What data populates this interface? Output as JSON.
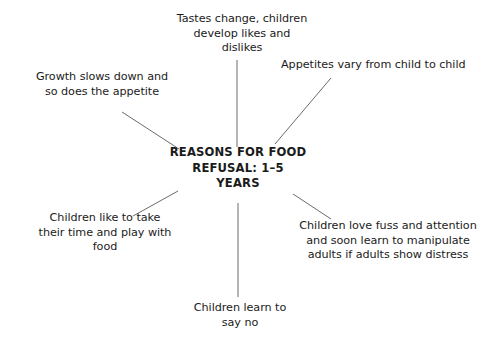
{
  "diagram": {
    "type": "radial-spoke-map",
    "background_color": "#ffffff",
    "text_color": "#1b1b1b",
    "line_color": "#6b6b6b",
    "center": {
      "label": "REASONS FOR FOOD\nREFUSAL: 1–5\nYEARS"
    },
    "branches": [
      {
        "id": "tastes-change",
        "position": "top",
        "label": "Tastes change, children\ndevelop likes and\ndislikes"
      },
      {
        "id": "appetites-vary",
        "position": "upper-right",
        "label": "Appetites vary from child to child"
      },
      {
        "id": "growth-slows",
        "position": "upper-left",
        "label": "Growth slows down and\nso does the appetite"
      },
      {
        "id": "take-their-time",
        "position": "lower-left",
        "label": "Children like to take\ntheir time and play with\nfood"
      },
      {
        "id": "fuss-and-attention",
        "position": "lower-right",
        "label": "Children love fuss and attention\nand soon learn to manipulate\nadults if adults show distress"
      },
      {
        "id": "learn-to-say-no",
        "position": "bottom",
        "label": "Children learn to\nsay no"
      }
    ],
    "connectors": [
      {
        "id": "connector-top",
        "x1": 237,
        "y1": 60,
        "x2": 237,
        "y2": 147
      },
      {
        "id": "connector-upper-right",
        "x1": 331,
        "y1": 78,
        "x2": 275,
        "y2": 144
      },
      {
        "id": "connector-upper-left",
        "x1": 122,
        "y1": 112,
        "x2": 179,
        "y2": 149
      },
      {
        "id": "connector-lower-left",
        "x1": 133,
        "y1": 216,
        "x2": 178,
        "y2": 191
      },
      {
        "id": "connector-lower-right",
        "x1": 331,
        "y1": 219,
        "x2": 293,
        "y2": 194
      },
      {
        "id": "connector-bottom",
        "x1": 238,
        "y1": 203,
        "x2": 238,
        "y2": 297
      }
    ]
  }
}
